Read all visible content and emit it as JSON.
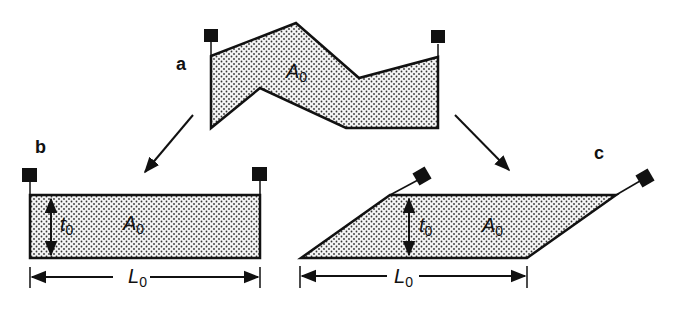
{
  "panels": {
    "a": {
      "label": "a",
      "area": "A",
      "area_sub": "0"
    },
    "b": {
      "label": "b",
      "area": "A",
      "area_sub": "0",
      "thickness": "t",
      "thickness_sub": "0",
      "length": "L",
      "length_sub": "0"
    },
    "c": {
      "label": "c",
      "area": "A",
      "area_sub": "0",
      "thickness": "t",
      "thickness_sub": "0",
      "length": "L",
      "length_sub": "0"
    }
  },
  "colors": {
    "ink": "#111111",
    "fill_dots": "#333333",
    "background": "#ffffff"
  }
}
